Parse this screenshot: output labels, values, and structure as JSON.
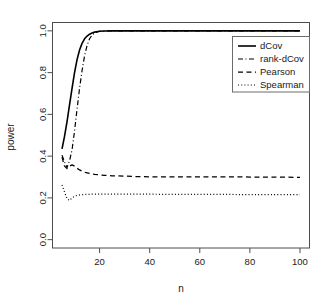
{
  "figure": {
    "title": "",
    "background": "#ffffff",
    "width": 329,
    "height": 303
  },
  "axes": {
    "xlabel": "n",
    "ylabel": "power",
    "x_ticks": [
      "20",
      "40",
      "60",
      "80",
      "100"
    ],
    "y_ticks": [
      "0.0",
      "0.2",
      "0.4",
      "0.6",
      "0.8",
      "1.0"
    ]
  },
  "legend": {
    "position": "top-right",
    "entries": [
      {
        "label": "dCov",
        "dash": "solid",
        "color": "#000000"
      },
      {
        "label": "rank-dCov",
        "dash": "dashdot",
        "color": "#000000"
      },
      {
        "label": "Pearson",
        "dash": "dashed",
        "color": "#000000"
      },
      {
        "label": "Spearman",
        "dash": "dotted",
        "color": "#000000"
      }
    ]
  },
  "chart_data": {
    "type": "line",
    "title": "",
    "xlabel": "n",
    "ylabel": "power",
    "xlim": [
      5,
      100
    ],
    "ylim": [
      0.0,
      1.0
    ],
    "xticks": [
      20,
      40,
      60,
      80,
      100
    ],
    "yticks": [
      0.0,
      0.2,
      0.4,
      0.6,
      0.8,
      1.0
    ],
    "grid": false,
    "legend_position": "top-right",
    "x": [
      5,
      6,
      7,
      8,
      9,
      10,
      11,
      12,
      13,
      14,
      15,
      16,
      17,
      18,
      20,
      22,
      25,
      30,
      35,
      40,
      45,
      50,
      55,
      60,
      65,
      70,
      75,
      80,
      85,
      90,
      95,
      100
    ],
    "series": [
      {
        "name": "dCov",
        "style": "solid",
        "color": "#000000",
        "values": [
          0.435,
          0.495,
          0.565,
          0.645,
          0.725,
          0.8,
          0.862,
          0.908,
          0.94,
          0.962,
          0.975,
          0.984,
          0.99,
          0.994,
          0.998,
          0.999,
          1.0,
          1.0,
          1.0,
          1.0,
          1.0,
          1.0,
          1.0,
          1.0,
          1.0,
          1.0,
          1.0,
          1.0,
          1.0,
          1.0,
          1.0,
          1.0
        ]
      },
      {
        "name": "rank-dCov",
        "style": "dashdot",
        "color": "#000000",
        "values": [
          0.405,
          0.372,
          0.345,
          0.378,
          0.43,
          0.52,
          0.625,
          0.725,
          0.81,
          0.88,
          0.93,
          0.962,
          0.98,
          0.99,
          0.998,
          0.999,
          1.0,
          1.0,
          1.0,
          1.0,
          1.0,
          1.0,
          1.0,
          1.0,
          1.0,
          1.0,
          1.0,
          1.0,
          1.0,
          1.0,
          1.0,
          1.0
        ]
      },
      {
        "name": "Pearson",
        "style": "dashed",
        "color": "#000000",
        "values": [
          0.395,
          0.352,
          0.34,
          0.352,
          0.358,
          0.352,
          0.342,
          0.334,
          0.328,
          0.323,
          0.32,
          0.317,
          0.315,
          0.313,
          0.31,
          0.308,
          0.306,
          0.304,
          0.302,
          0.301,
          0.301,
          0.301,
          0.301,
          0.301,
          0.301,
          0.301,
          0.301,
          0.3,
          0.3,
          0.3,
          0.299,
          0.298
        ]
      },
      {
        "name": "Spearman",
        "style": "dotted",
        "color": "#000000",
        "values": [
          0.262,
          0.228,
          0.196,
          0.188,
          0.2,
          0.208,
          0.212,
          0.214,
          0.215,
          0.216,
          0.217,
          0.217,
          0.218,
          0.218,
          0.218,
          0.218,
          0.218,
          0.218,
          0.218,
          0.218,
          0.217,
          0.217,
          0.217,
          0.217,
          0.217,
          0.217,
          0.216,
          0.216,
          0.216,
          0.216,
          0.216,
          0.215
        ]
      }
    ]
  }
}
